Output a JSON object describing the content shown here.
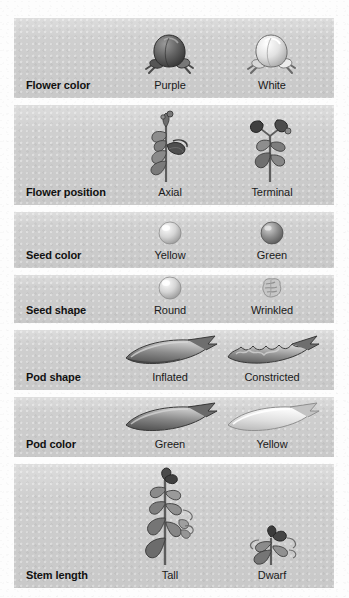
{
  "figure": {
    "background_color": "#fdfdfd",
    "band_color": "#cfcfcf",
    "label_color": "#111111"
  },
  "columns": {
    "trait_header": "Character",
    "dominant_header": "Dominant",
    "recessive_header": "Recessive",
    "dominant_center_x": 170,
    "recessive_center_x": 272
  },
  "rows": [
    {
      "trait": "Flower color",
      "height": 80,
      "dominant": {
        "label": "Purple",
        "art": "flower-purple-icon"
      },
      "recessive": {
        "label": "White",
        "art": "flower-white-icon"
      }
    },
    {
      "trait": "Flower position",
      "height": 100,
      "dominant": {
        "label": "Axial",
        "art": "plant-axial-icon"
      },
      "recessive": {
        "label": "Terminal",
        "art": "plant-terminal-icon"
      }
    },
    {
      "trait": "Seed color",
      "height": 56,
      "dominant": {
        "label": "Yellow",
        "art": "seed-yellow-icon"
      },
      "recessive": {
        "label": "Green",
        "art": "seed-green-icon"
      }
    },
    {
      "trait": "Seed shape",
      "height": 48,
      "dominant": {
        "label": "Round",
        "art": "seed-round-icon"
      },
      "recessive": {
        "label": "Wrinkled",
        "art": "seed-wrinkled-icon"
      }
    },
    {
      "trait": "Pod shape",
      "height": 60,
      "dominant": {
        "label": "Inflated",
        "art": "pod-inflated-icon"
      },
      "recessive": {
        "label": "Constricted",
        "art": "pod-constricted-icon"
      }
    },
    {
      "trait": "Pod color",
      "height": 60,
      "dominant": {
        "label": "Green",
        "art": "pod-green-icon"
      },
      "recessive": {
        "label": "Yellow",
        "art": "pod-yellow-icon"
      }
    },
    {
      "trait": "Stem length",
      "height": 124,
      "dominant": {
        "label": "Tall",
        "art": "plant-tall-icon"
      },
      "recessive": {
        "label": "Dwarf",
        "art": "plant-dwarf-icon"
      }
    }
  ]
}
